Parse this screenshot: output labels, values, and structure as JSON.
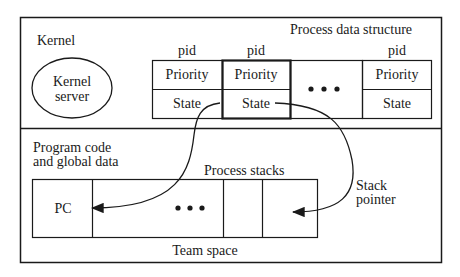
{
  "kernel": {
    "label": "Kernel",
    "server_label_line1": "Kernel",
    "server_label_line2": "server"
  },
  "process_data_structure": {
    "title": "Process data structure",
    "columns": [
      {
        "header": "pid",
        "row1": "Priority",
        "row2": "State",
        "highlighted": false
      },
      {
        "header": "pid",
        "row1": "Priority",
        "row2": "State",
        "highlighted": true
      },
      {
        "header": "",
        "ellipsis": "•••"
      },
      {
        "header": "pid",
        "row1": "Priority",
        "row2": "State",
        "highlighted": false
      }
    ]
  },
  "team_space": {
    "program_code_line1": "Program code",
    "program_code_line2": "and global data",
    "process_stacks_label": "Process stacks",
    "pc_label": "PC",
    "ellipsis": "•••",
    "footer_label": "Team space",
    "stack_pointer_line1": "Stack",
    "stack_pointer_line2": "pointer"
  },
  "colors": {
    "line": "#1a1a1a",
    "background": "#ffffff"
  }
}
